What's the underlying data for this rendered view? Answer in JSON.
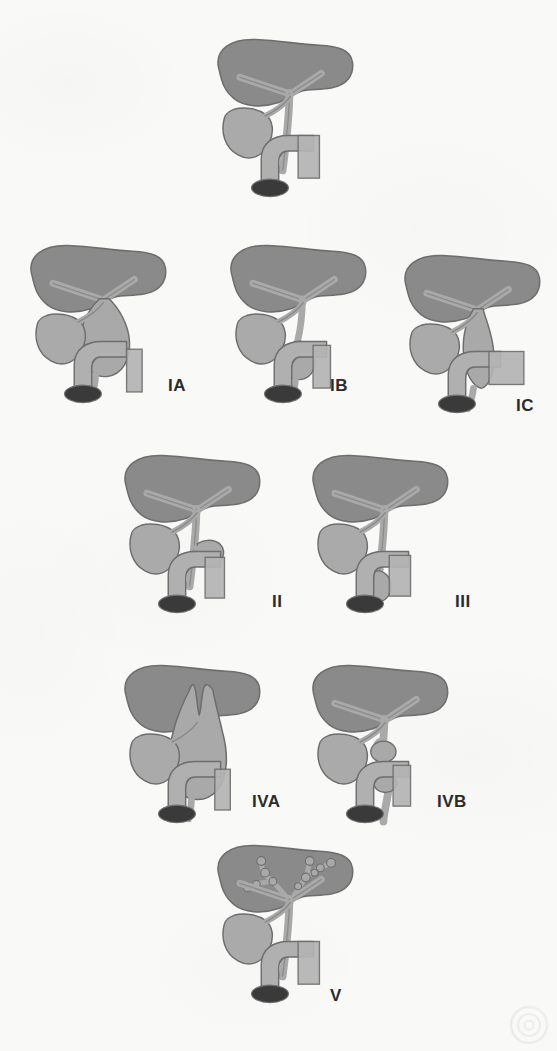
{
  "figure": {
    "background_color": "#f9f9f8",
    "colors": {
      "liver": "#8a8a8a",
      "liver_dark": "#787878",
      "duct": "#a9a9a9",
      "gallbladder": "#aaaaaa",
      "duodenum": "#b0b0b0",
      "pancreas": "#b4b4b4",
      "lumen": "#3a3a3a",
      "outline": "#6e6e6e",
      "label_text": "#2b2b2b"
    }
  },
  "panels": [
    {
      "id": "normal",
      "label": "",
      "anatomy_note": "Normal biliary tree",
      "x": 205,
      "y": 22,
      "w": 160,
      "h": 195
    },
    {
      "id": "IA",
      "label": "IA",
      "anatomy_note": "Cystic dilatation of entire common bile duct",
      "x": 18,
      "y": 228,
      "w": 160,
      "h": 195,
      "label_x": 168,
      "label_y": 376
    },
    {
      "id": "IB",
      "label": "IB",
      "anatomy_note": "Focal segmental dilatation of common bile duct",
      "x": 218,
      "y": 228,
      "w": 160,
      "h": 195,
      "label_x": 330,
      "label_y": 376
    },
    {
      "id": "IC",
      "label": "IC",
      "anatomy_note": "Fusiform dilatation of common bile duct",
      "x": 392,
      "y": 238,
      "w": 160,
      "h": 195,
      "label_x": 516,
      "label_y": 396
    },
    {
      "id": "II",
      "label": "II",
      "anatomy_note": "True diverticulum of extrahepatic bile duct",
      "x": 112,
      "y": 438,
      "w": 160,
      "h": 195,
      "label_x": 272,
      "label_y": 592
    },
    {
      "id": "III",
      "label": "III",
      "anatomy_note": "Choledochocele of intraduodenal bile duct",
      "x": 300,
      "y": 438,
      "w": 160,
      "h": 195,
      "label_x": 455,
      "label_y": 592
    },
    {
      "id": "IVA",
      "label": "IVA",
      "anatomy_note": "Multiple intrahepatic and extrahepatic duct cysts",
      "x": 112,
      "y": 648,
      "w": 160,
      "h": 195,
      "label_x": 252,
      "label_y": 792
    },
    {
      "id": "IVB",
      "label": "IVB",
      "anatomy_note": "Multiple extrahepatic duct cysts only",
      "x": 300,
      "y": 648,
      "w": 160,
      "h": 195,
      "label_x": 437,
      "label_y": 792
    },
    {
      "id": "V",
      "label": "V",
      "anatomy_note": "Caroli disease - intrahepatic duct cysts",
      "x": 205,
      "y": 828,
      "w": 160,
      "h": 195,
      "label_x": 330,
      "label_y": 986
    }
  ],
  "watermark": {
    "name": "circular-watermark",
    "visible": true
  }
}
